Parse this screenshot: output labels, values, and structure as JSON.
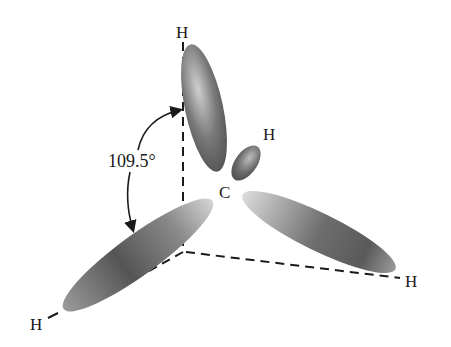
{
  "diagram": {
    "center_atom": "C",
    "ligand_atoms": [
      "H",
      "H",
      "H",
      "H"
    ],
    "bond_angle_label": "109.5°",
    "colors": {
      "orbital_dark": "#555555",
      "orbital_light": "#d8d8d8",
      "line": "#1a1a1a",
      "background": "#ffffff"
    }
  }
}
